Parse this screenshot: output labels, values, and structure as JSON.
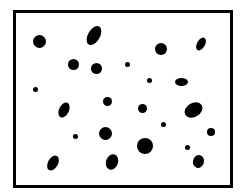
{
  "frame": {
    "border_color": "#000000",
    "background": "#ffffff"
  },
  "dots": [
    {
      "x": 39,
      "y": 41,
      "w": 13,
      "h": 13,
      "rot": 0
    },
    {
      "x": 94,
      "y": 35,
      "w": 12,
      "h": 21,
      "rot": 30
    },
    {
      "x": 73,
      "y": 64,
      "w": 11,
      "h": 11,
      "rot": 0
    },
    {
      "x": 96,
      "y": 68,
      "w": 11,
      "h": 11,
      "rot": 0
    },
    {
      "x": 35,
      "y": 89,
      "w": 5,
      "h": 5,
      "rot": 0
    },
    {
      "x": 161,
      "y": 49,
      "w": 12,
      "h": 12,
      "rot": 0
    },
    {
      "x": 201,
      "y": 44,
      "w": 8,
      "h": 14,
      "rot": 30
    },
    {
      "x": 127,
      "y": 64,
      "w": 5,
      "h": 5,
      "rot": 0
    },
    {
      "x": 149,
      "y": 80,
      "w": 5,
      "h": 5,
      "rot": 0
    },
    {
      "x": 181,
      "y": 82,
      "w": 13,
      "h": 8,
      "rot": 0
    },
    {
      "x": 64,
      "y": 110,
      "w": 10,
      "h": 16,
      "rot": 25
    },
    {
      "x": 107,
      "y": 101,
      "w": 9,
      "h": 9,
      "rot": 0
    },
    {
      "x": 142,
      "y": 108,
      "w": 9,
      "h": 9,
      "rot": 0
    },
    {
      "x": 193,
      "y": 110,
      "w": 19,
      "h": 14,
      "rot": -30
    },
    {
      "x": 75,
      "y": 136,
      "w": 5,
      "h": 5,
      "rot": 0
    },
    {
      "x": 105,
      "y": 133,
      "w": 13,
      "h": 13,
      "rot": 0
    },
    {
      "x": 163,
      "y": 124,
      "w": 5,
      "h": 5,
      "rot": 0
    },
    {
      "x": 211,
      "y": 132,
      "w": 8,
      "h": 8,
      "rot": 0
    },
    {
      "x": 145,
      "y": 146,
      "w": 16,
      "h": 16,
      "rot": 0
    },
    {
      "x": 187,
      "y": 147,
      "w": 5,
      "h": 5,
      "rot": 0
    },
    {
      "x": 53,
      "y": 163,
      "w": 10,
      "h": 16,
      "rot": 30
    },
    {
      "x": 112,
      "y": 162,
      "w": 12,
      "h": 16,
      "rot": 20
    },
    {
      "x": 198,
      "y": 161,
      "w": 11,
      "h": 13,
      "rot": 15
    }
  ]
}
